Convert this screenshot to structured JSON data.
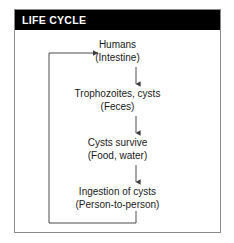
{
  "figure": {
    "title": "LIFE CYCLE",
    "colors": {
      "title_bar_background": "#000000",
      "title_text": "#ffffff",
      "panel_border": "#8a8a8a",
      "body_text": "#1a1a1a",
      "connector": "#4d4d4d",
      "background": "#ffffff"
    }
  },
  "diagram": {
    "type": "cycle-flowchart",
    "nodes": [
      {
        "id": "humans",
        "primary": "Humans",
        "secondary": "(Intestine)"
      },
      {
        "id": "trophozoites",
        "primary": "Trophozoites, cysts",
        "secondary": "(Feces)"
      },
      {
        "id": "cysts-survive",
        "primary": "Cysts survive",
        "secondary": "(Food, water)"
      },
      {
        "id": "ingestion",
        "primary": "Ingestion of cysts",
        "secondary": "(Person-to-person)"
      }
    ],
    "edges": [
      {
        "from": "humans",
        "to": "trophozoites",
        "style": "straight-down-arrow"
      },
      {
        "from": "trophozoites",
        "to": "cysts-survive",
        "style": "straight-down-arrow"
      },
      {
        "from": "cysts-survive",
        "to": "ingestion",
        "style": "straight-down-arrow"
      },
      {
        "from": "ingestion",
        "to": "humans",
        "style": "feedback-loop-left-arrow"
      }
    ]
  }
}
